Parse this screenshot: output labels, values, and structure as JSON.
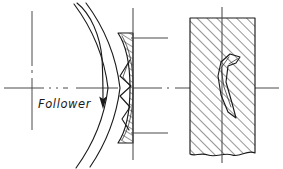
{
  "drawing": {
    "title": "Cam follower contact fracture section detail",
    "type": "engineering-line-drawing",
    "background_color": "#ffffff",
    "line_color": "#1a1a1a",
    "centerline_color": "#4a4a4a",
    "hatch_color": "#303030",
    "canvas": {
      "width": 283,
      "height": 169
    }
  },
  "annotations": {
    "follower_label": "Follower"
  },
  "elements": {
    "horizontal_centerline": {
      "name": "horizontal-axis-centerline",
      "style": "dash-dot",
      "y": 88,
      "x_start": 4,
      "x_end": 279
    },
    "vertical_centerline_left": {
      "name": "left-vertical-centerline",
      "style": "dash-dot",
      "x": 32,
      "y_start": 11,
      "y_end": 130
    },
    "vertical_centerline_follower": {
      "name": "follower-vertical-centerline",
      "style": "continuous",
      "x": 133,
      "y_start": 8,
      "y_end": 160
    },
    "vertical_centerline_block": {
      "name": "block-vertical-centerline",
      "style": "continuous",
      "x": 222,
      "y_start": 7,
      "y_end": 163
    },
    "motion_arrow": {
      "name": "follower-motion-arrow",
      "direction": "downward-curved"
    },
    "cam_arc_outer": {
      "name": "cam-profile-arc-outer"
    },
    "cam_arc_inner": {
      "name": "cam-profile-arc-inner"
    },
    "follower_section": {
      "name": "follower-hatched-section",
      "hatch_angle_deg": 55,
      "has_crack": true
    },
    "block_section": {
      "name": "block-hatched-section",
      "hatch_angle_deg": 45,
      "has_crack": true,
      "bottom_edge": "break-line",
      "x_left": 190,
      "x_right": 255,
      "y_top": 18,
      "y_bottom": 155
    },
    "extension_line_top": {
      "name": "top-extension-line",
      "y": 38,
      "x_start": 131,
      "x_end": 168
    },
    "extension_line_bottom": {
      "name": "bottom-extension-line",
      "y": 133,
      "x_start": 131,
      "x_end": 168
    }
  }
}
